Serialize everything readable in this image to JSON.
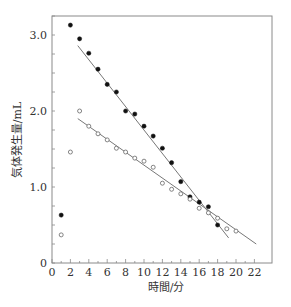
{
  "chart_data": {
    "type": "scatter",
    "title": "",
    "xlabel": "時間/分",
    "ylabel": "気体発生量/mL",
    "xlim": [
      0,
      23
    ],
    "ylim": [
      0,
      3.25
    ],
    "xticks": [
      0,
      2,
      4,
      6,
      8,
      10,
      12,
      14,
      16,
      18,
      20,
      22
    ],
    "yticks": [
      0,
      1.0,
      2.0,
      3.0
    ],
    "ytick_labels": [
      "0",
      "1.0",
      "2.0",
      "3.0"
    ],
    "y_minor_step": 0.25,
    "x_minor_step": 1,
    "grid": false,
    "legend": null,
    "series": [
      {
        "name": "filled",
        "marker": "filled-circle",
        "x": [
          1,
          2,
          3,
          4,
          5,
          6,
          7,
          8,
          9,
          10,
          11,
          12,
          13,
          14,
          15,
          16,
          17,
          18
        ],
        "y": [
          0.63,
          3.13,
          2.95,
          2.76,
          2.55,
          2.35,
          2.25,
          2.0,
          1.96,
          1.8,
          1.67,
          1.51,
          1.32,
          1.07,
          0.87,
          0.8,
          0.74,
          0.5
        ],
        "fit_line": {
          "x": [
            2.8,
            19.2
          ],
          "y": [
            2.86,
            0.33
          ]
        }
      },
      {
        "name": "open",
        "marker": "open-circle",
        "x": [
          1,
          2,
          3,
          4,
          5,
          6,
          7,
          8,
          9,
          10,
          11,
          12,
          13,
          14,
          15,
          16,
          17,
          18,
          19,
          20
        ],
        "y": [
          0.37,
          1.46,
          2.0,
          1.8,
          1.7,
          1.62,
          1.51,
          1.46,
          1.38,
          1.34,
          1.26,
          1.05,
          0.97,
          0.91,
          0.84,
          0.72,
          0.66,
          0.59,
          0.45,
          0.42
        ],
        "fit_line": {
          "x": [
            2.8,
            22.2
          ],
          "y": [
            1.9,
            0.25
          ]
        }
      }
    ]
  }
}
